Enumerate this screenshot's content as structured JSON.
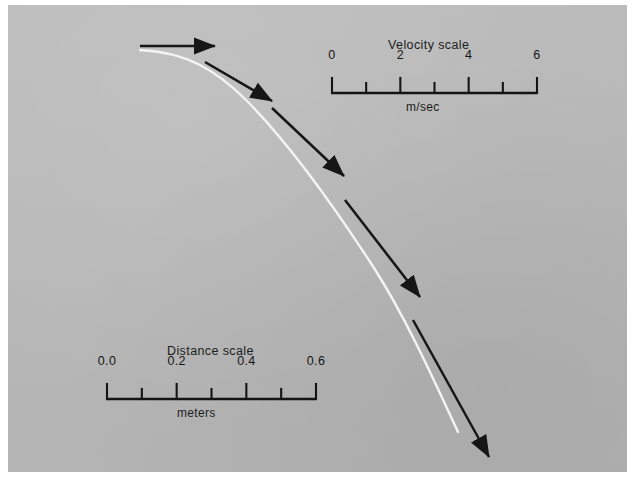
{
  "figure": {
    "kind": "stroboscopic-photograph",
    "background_color": "#b9b9b9",
    "print_border_color": "#ffffff",
    "curve_color": "#f2f2f2",
    "vector_color": "#161616"
  },
  "velocity_scale": {
    "title": "Velocity scale",
    "unit_label": "m/sec",
    "tick_labels": [
      "0",
      "2",
      "4",
      "6"
    ],
    "tick_values": [
      0,
      1,
      2,
      3,
      4,
      5,
      6
    ],
    "labeled_values": [
      0,
      2,
      4,
      6
    ],
    "axis_min": 0,
    "axis_max": 6
  },
  "distance_scale": {
    "title": "Distance scale",
    "unit_label": "meters",
    "tick_labels": [
      "0.0",
      "0.2",
      "0.4",
      "0.6"
    ],
    "tick_values": [
      0.0,
      0.1,
      0.2,
      0.3,
      0.4,
      0.5,
      0.6
    ],
    "labeled_values": [
      0.0,
      0.2,
      0.4,
      0.6
    ],
    "axis_min": 0.0,
    "axis_max": 0.6
  },
  "chart_data": {
    "type": "scatter",
    "xlabel": "meters",
    "ylabel": "meters",
    "annotations": [
      "Velocity scale",
      "m/sec",
      "Distance scale",
      "meters"
    ],
    "trajectory_path": "M 140 50 C 186 52 216 70 246 100 C 286 140 330 200 374 268 C 406 318 434 380 458 432",
    "velocity_vectors": [
      {
        "index": 1,
        "x1": 140,
        "y1": 46,
        "x2": 215,
        "y2": 46,
        "speed_m_per_s": 2.0
      },
      {
        "index": 2,
        "x1": 205,
        "y1": 62,
        "x2": 272,
        "y2": 101,
        "speed_m_per_s": 2.1
      },
      {
        "index": 3,
        "x1": 272,
        "y1": 108,
        "x2": 344,
        "y2": 176,
        "speed_m_per_s": 2.6
      },
      {
        "index": 4,
        "x1": 345,
        "y1": 200,
        "x2": 420,
        "y2": 297,
        "speed_m_per_s": 3.3
      },
      {
        "index": 5,
        "x1": 413,
        "y1": 320,
        "x2": 489,
        "y2": 457,
        "speed_m_per_s": 4.2
      }
    ]
  }
}
